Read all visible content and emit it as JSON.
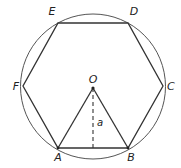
{
  "diagram": {
    "colors": {
      "stroke": "#333333",
      "circle": "#555555",
      "background": "#ffffff"
    },
    "circle": {
      "cx": 93,
      "cy": 86.5,
      "r": 72.5
    },
    "center": {
      "label": "O",
      "x": 93,
      "y": 88
    },
    "vertices": [
      {
        "label": "A",
        "x": 58,
        "y": 148
      },
      {
        "label": "B",
        "x": 128,
        "y": 148
      },
      {
        "label": "C",
        "x": 163,
        "y": 86
      },
      {
        "label": "D",
        "x": 128,
        "y": 23
      },
      {
        "label": "E",
        "x": 58,
        "y": 23
      },
      {
        "label": "F",
        "x": 23,
        "y": 86
      }
    ],
    "apothem": {
      "label": "a",
      "from": "O",
      "to_x": 93,
      "to_y": 148,
      "style": "dashed"
    },
    "triangle": [
      "O",
      "A",
      "B"
    ]
  }
}
